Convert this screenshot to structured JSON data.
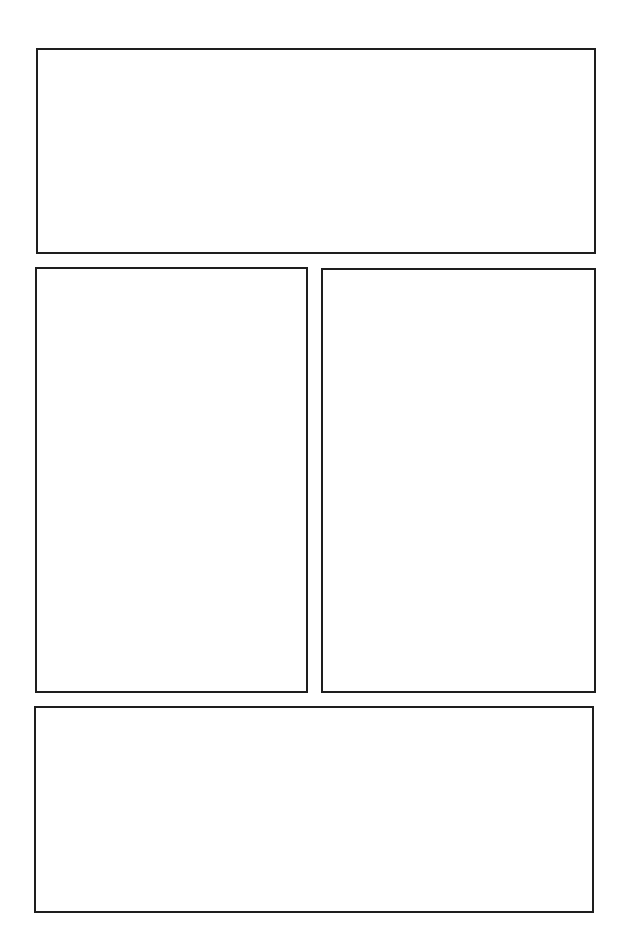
{
  "page": {
    "type": "comic-panel-template",
    "background_color": "#ffffff",
    "border_color": "#1e1e1e",
    "panel_count": 4
  },
  "panels": [
    {
      "id": "panel-1",
      "position": "top",
      "content": ""
    },
    {
      "id": "panel-2",
      "position": "middle-left",
      "content": ""
    },
    {
      "id": "panel-3",
      "position": "middle-right",
      "content": ""
    },
    {
      "id": "panel-4",
      "position": "bottom",
      "content": ""
    }
  ]
}
